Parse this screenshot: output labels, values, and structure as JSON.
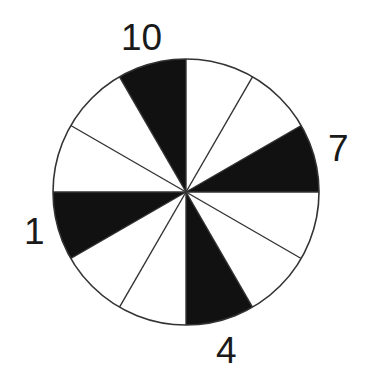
{
  "diagram": {
    "type": "clock-wheel",
    "sector_count": 12,
    "sector_angle_deg": 30,
    "colors": {
      "filled": "#111111",
      "empty": "#ffffff",
      "stroke": "#333333"
    },
    "filled_sectors": [
      {
        "from_clock": 11,
        "to_clock": 12,
        "label": "10"
      },
      {
        "from_clock": 2,
        "to_clock": 3,
        "label": "7"
      },
      {
        "from_clock": 5,
        "to_clock": 6,
        "label": "4"
      },
      {
        "from_clock": 8,
        "to_clock": 9,
        "label": "1"
      }
    ],
    "labels": {
      "top": "10",
      "right": "7",
      "bottom": "4",
      "left": "1"
    }
  }
}
